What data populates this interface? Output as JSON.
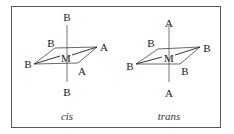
{
  "diagram": {
    "panels": [
      {
        "caption": "cis",
        "center": "M",
        "top": "B",
        "bottom": "B",
        "back_left": "B",
        "back_right": "A",
        "front_left": "B",
        "front_right": "A"
      },
      {
        "caption": "trans",
        "center": "M",
        "top": "A",
        "bottom": "A",
        "back_left": "B",
        "back_right": "B",
        "front_left": "B",
        "front_right": "B"
      }
    ]
  }
}
